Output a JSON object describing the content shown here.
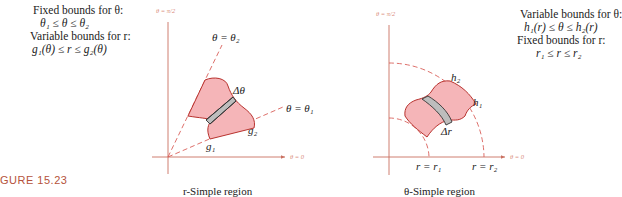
{
  "figure": {
    "label": "GURE 15.23",
    "colors": {
      "axis": "#c97060",
      "dashed_line": "#d9605a",
      "region_fill": "#f5b5b8",
      "region_stroke": "#b8322e",
      "strip_fill": "#bdbdbd",
      "strip_stroke": "#333333",
      "label_accent": "#b5533b"
    }
  },
  "left_panel": {
    "bounds_text": {
      "line1": "Fixed bounds for θ:",
      "line2": "θ₁ ≤ θ ≤ θ₂",
      "line3": "Variable bounds for r:",
      "line4": "g₁(θ) ≤ r ≤ g₂(θ)"
    },
    "axis_labels": {
      "vertical": "θ = π/2",
      "horizontal": "θ = 0"
    },
    "ray_labels": {
      "theta2": "θ = θ₂",
      "theta1": "θ = θ₁"
    },
    "curve_labels": {
      "g1": "g₁",
      "g2": "g₂",
      "delta": "Δθ"
    },
    "caption": "r-Simple region"
  },
  "right_panel": {
    "bounds_text": {
      "line1": "Variable bounds for θ:",
      "line2": "h₁(r) ≤ θ ≤ h₂(r)",
      "line3": "Fixed bounds for r:",
      "line4": "r₁ ≤ r ≤ r₂"
    },
    "axis_labels": {
      "vertical": "θ = π/2",
      "horizontal": "θ = 0"
    },
    "arc_labels": {
      "r1": "r = r₁",
      "r2": "r = r₂"
    },
    "curve_labels": {
      "h1": "h₁",
      "h2": "h₂",
      "delta": "Δr"
    },
    "caption": "θ-Simple region"
  }
}
